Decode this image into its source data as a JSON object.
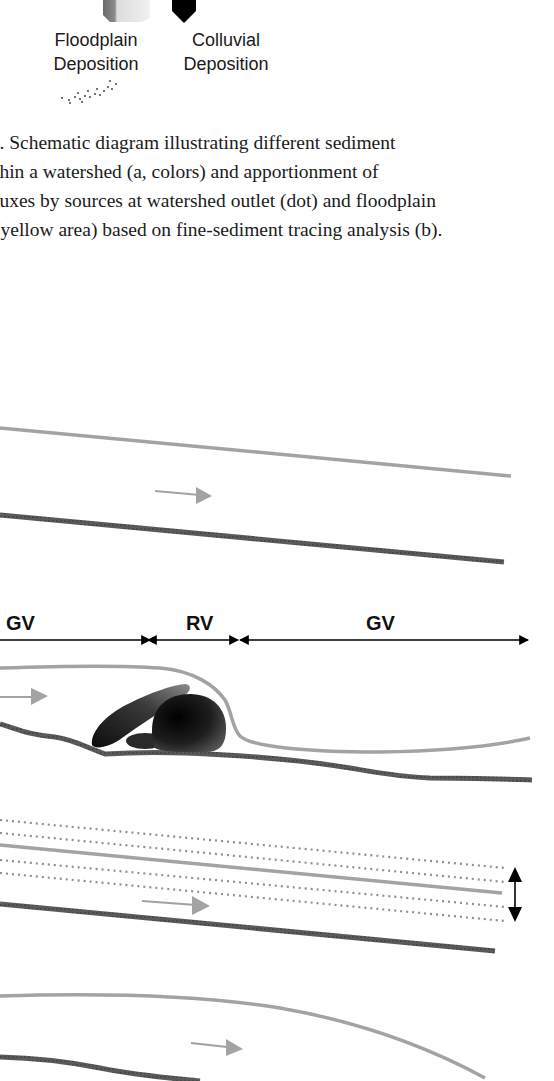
{
  "legend": {
    "items": [
      {
        "label_line1": "Floodplain",
        "label_line2": "Deposition",
        "icon": "floodplain-block-icon"
      },
      {
        "label_line1": "Colluvial",
        "label_line2": "Deposition",
        "icon": "colluvial-pentagon-icon"
      }
    ]
  },
  "caption": {
    "lines": [
      "/. Schematic diagram illustrating different sediment",
      "thin a watershed (a, colors) and apportionment of",
      "luxes by sources at watershed outlet (dot) and floodplain",
      " (yellow area) based on fine-sediment tracing analysis (b)."
    ]
  },
  "diagram": {
    "segments": [
      {
        "label": "GV",
        "x": 25
      },
      {
        "label": "RV",
        "x": 200
      },
      {
        "label": "GV",
        "x": 380
      }
    ],
    "colors": {
      "bank_line": "#a0a0a0",
      "bed_line": "#5a5a5a",
      "flow_arrow": "#a0a0a0",
      "dotted_line": "#909090",
      "boulder": "#1a1a1a",
      "dimension_arrow": "#000000"
    }
  }
}
